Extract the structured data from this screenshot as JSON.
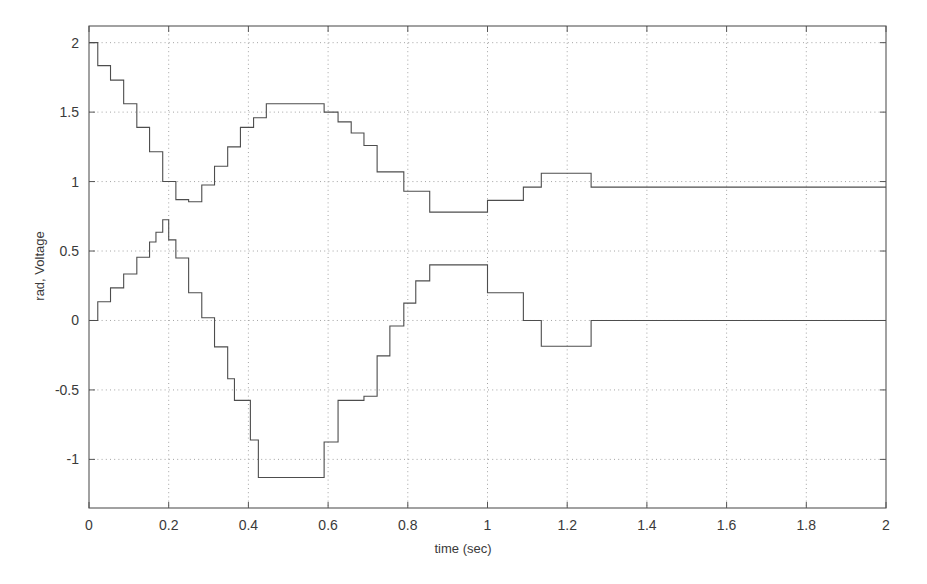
{
  "chart_data": {
    "type": "line",
    "title": "",
    "xlabel": "time (sec)",
    "ylabel": "rad, Voltage",
    "xlim": [
      0,
      2
    ],
    "ylim": [
      -1.35,
      2.12
    ],
    "xticks": [
      0,
      0.2,
      0.4,
      0.6,
      0.8,
      1,
      1.2,
      1.4,
      1.6,
      1.8,
      2
    ],
    "xticklabels": [
      "0",
      "0.2",
      "0.4",
      "0.6",
      "0.8",
      "1",
      "1.2",
      "1.4",
      "1.6",
      "1.8",
      "2"
    ],
    "yticks": [
      -1,
      -0.5,
      0,
      0.5,
      1,
      1.5,
      2
    ],
    "yticklabels": [
      "-1",
      "-0.5",
      "0",
      "0.5",
      "1",
      "1.5",
      "2"
    ],
    "grid": true,
    "grid_style": "dotted",
    "legend": "none",
    "drawstyle": "steps-post",
    "line_color": "#4d4d4d",
    "axis_color": "#555555",
    "grid_color": "#9a9a9a",
    "background": "#ffffff",
    "series": [
      {
        "name": "upper",
        "x": [
          0,
          0.0333,
          0.0667,
          0.1,
          0.1333,
          0.1667,
          0.2,
          0.2333,
          0.2667,
          0.3,
          0.3333,
          0.3667,
          0.4,
          0.4333,
          0.4667,
          0.5,
          0.5333,
          0.5667,
          0.6,
          0.6333,
          0.6667,
          0.7,
          0.7333,
          0.8,
          0.9,
          1.0,
          1.1,
          1.2,
          1.3,
          1.4,
          1.5,
          1.6,
          1.7,
          1.8,
          1.9,
          2.0
        ],
        "values": [
          2.0,
          2.0,
          1.83,
          1.73,
          1.56,
          1.38,
          1.21,
          1.0,
          0.86,
          0.85,
          0.97,
          1.12,
          1.25,
          1.38,
          1.46,
          1.56,
          1.56,
          1.56,
          1.56,
          1.5,
          1.44,
          1.36,
          1.26,
          1.08,
          0.93,
          0.78,
          0.78,
          0.86,
          0.86,
          0.96,
          1.06,
          1.06,
          0.96,
          0.96,
          0.96,
          0.96
        ]
      },
      {
        "name": "lower",
        "x": [
          0,
          0.0333,
          0.0667,
          0.1,
          0.1333,
          0.1667,
          0.2,
          0.2333,
          0.2667,
          0.3,
          0.3333,
          0.3667,
          0.4,
          0.4333,
          0.4667,
          0.5,
          0.5333,
          0.5667,
          0.6,
          0.6333,
          0.6667,
          0.7,
          0.7333,
          0.8,
          0.9,
          1.0,
          1.1,
          1.2,
          1.3,
          1.4,
          1.5,
          1.6,
          1.7,
          1.8,
          1.9,
          2.0
        ],
        "values": [
          0.0,
          0.0,
          0.13,
          0.23,
          0.33,
          0.45,
          0.63,
          0.72,
          0.58,
          0.45,
          0.2,
          0.02,
          -0.18,
          -0.42,
          -0.57,
          -0.57,
          -0.86,
          -1.13,
          -1.13,
          -1.13,
          -1.13,
          -1.13,
          -0.88,
          -0.57,
          -0.55,
          -0.25,
          -0.04,
          0.12,
          0.28,
          0.4,
          0.4,
          0.2,
          0.2,
          0.0,
          -0.18,
          -0.18
        ]
      }
    ],
    "series_steps": {
      "upper": [
        [
          0.0,
          2.0
        ],
        [
          0.022,
          2.0
        ],
        [
          0.022,
          1.835
        ],
        [
          0.054,
          1.835
        ],
        [
          0.054,
          1.73
        ],
        [
          0.087,
          1.73
        ],
        [
          0.087,
          1.56
        ],
        [
          0.12,
          1.56
        ],
        [
          0.12,
          1.39
        ],
        [
          0.152,
          1.39
        ],
        [
          0.152,
          1.215
        ],
        [
          0.185,
          1.215
        ],
        [
          0.185,
          1.0
        ],
        [
          0.218,
          1.0
        ],
        [
          0.218,
          0.87
        ],
        [
          0.25,
          0.87
        ],
        [
          0.25,
          0.855
        ],
        [
          0.283,
          0.855
        ],
        [
          0.283,
          0.975
        ],
        [
          0.315,
          0.975
        ],
        [
          0.315,
          1.11
        ],
        [
          0.348,
          1.11
        ],
        [
          0.348,
          1.25
        ],
        [
          0.38,
          1.25
        ],
        [
          0.38,
          1.39
        ],
        [
          0.413,
          1.39
        ],
        [
          0.413,
          1.46
        ],
        [
          0.445,
          1.46
        ],
        [
          0.445,
          1.56
        ],
        [
          0.59,
          1.56
        ],
        [
          0.59,
          1.5
        ],
        [
          0.625,
          1.5
        ],
        [
          0.625,
          1.43
        ],
        [
          0.658,
          1.43
        ],
        [
          0.658,
          1.35
        ],
        [
          0.69,
          1.35
        ],
        [
          0.69,
          1.26
        ],
        [
          0.723,
          1.26
        ],
        [
          0.723,
          1.07
        ],
        [
          0.79,
          1.07
        ],
        [
          0.79,
          0.93
        ],
        [
          0.855,
          0.93
        ],
        [
          0.855,
          0.78
        ],
        [
          1.0,
          0.78
        ],
        [
          1.0,
          0.865
        ],
        [
          1.09,
          0.865
        ],
        [
          1.09,
          0.96
        ],
        [
          1.135,
          0.96
        ],
        [
          1.135,
          1.06
        ],
        [
          1.26,
          1.06
        ],
        [
          1.26,
          0.96
        ],
        [
          2.0,
          0.96
        ]
      ],
      "lower": [
        [
          0.0,
          0.0
        ],
        [
          0.022,
          0.0
        ],
        [
          0.022,
          0.135
        ],
        [
          0.054,
          0.135
        ],
        [
          0.054,
          0.235
        ],
        [
          0.087,
          0.235
        ],
        [
          0.087,
          0.335
        ],
        [
          0.12,
          0.335
        ],
        [
          0.12,
          0.455
        ],
        [
          0.152,
          0.455
        ],
        [
          0.152,
          0.565
        ],
        [
          0.168,
          0.565
        ],
        [
          0.168,
          0.635
        ],
        [
          0.185,
          0.635
        ],
        [
          0.185,
          0.725
        ],
        [
          0.2,
          0.725
        ],
        [
          0.2,
          0.58
        ],
        [
          0.218,
          0.58
        ],
        [
          0.218,
          0.45
        ],
        [
          0.25,
          0.45
        ],
        [
          0.25,
          0.2
        ],
        [
          0.283,
          0.2
        ],
        [
          0.283,
          0.02
        ],
        [
          0.315,
          0.02
        ],
        [
          0.315,
          -0.19
        ],
        [
          0.348,
          -0.19
        ],
        [
          0.348,
          -0.42
        ],
        [
          0.365,
          -0.42
        ],
        [
          0.365,
          -0.575
        ],
        [
          0.405,
          -0.575
        ],
        [
          0.405,
          -0.86
        ],
        [
          0.425,
          -0.86
        ],
        [
          0.425,
          -1.13
        ],
        [
          0.5,
          -1.13
        ],
        [
          0.5,
          -1.13
        ],
        [
          0.59,
          -1.13
        ],
        [
          0.59,
          -0.875
        ],
        [
          0.625,
          -0.875
        ],
        [
          0.625,
          -0.575
        ],
        [
          0.69,
          -0.575
        ],
        [
          0.69,
          -0.545
        ],
        [
          0.723,
          -0.545
        ],
        [
          0.723,
          -0.255
        ],
        [
          0.755,
          -0.255
        ],
        [
          0.755,
          -0.04
        ],
        [
          0.79,
          -0.04
        ],
        [
          0.79,
          0.125
        ],
        [
          0.82,
          0.125
        ],
        [
          0.82,
          0.285
        ],
        [
          0.855,
          0.285
        ],
        [
          0.855,
          0.4
        ],
        [
          0.935,
          0.4
        ],
        [
          0.935,
          0.4
        ],
        [
          1.0,
          0.4
        ],
        [
          1.0,
          0.2
        ],
        [
          1.09,
          0.2
        ],
        [
          1.09,
          0.0
        ],
        [
          1.135,
          0.0
        ],
        [
          1.135,
          -0.185
        ],
        [
          1.26,
          -0.185
        ],
        [
          1.26,
          0.0
        ],
        [
          2.0,
          0.0
        ]
      ]
    }
  },
  "axes": {
    "x_axis_label": "time (sec)",
    "y_axis_label": "rad, Voltage"
  }
}
